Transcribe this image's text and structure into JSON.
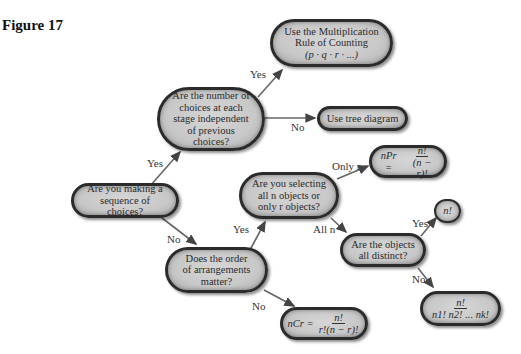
{
  "figure": {
    "label": "Figure 17"
  },
  "colors": {
    "node_fill": "#c8c8c8",
    "node_border": "#2b2b2b",
    "arrow": "#555555",
    "text": "#2a2a2a"
  },
  "nodes": {
    "start": {
      "text": "Are you making a sequence of choices?"
    },
    "independent": {
      "text": "Are the number of choices at each stage independent of previous choices?"
    },
    "multiplication": {
      "line1": "Use the Multiplication",
      "line2": "Rule of Counting",
      "line3": "(p · q · r · ...)"
    },
    "tree": {
      "text": "Use tree diagram"
    },
    "order": {
      "text": "Does the order of arrangements matter?"
    },
    "selecting": {
      "line1": "Are you selecting",
      "line2": "all n objects or",
      "line3": "only r objects?"
    },
    "permutation": {
      "lhs": "nPr =",
      "num": "n!",
      "den": "(n − r)!"
    },
    "distinct": {
      "text": "Are the objects all distinct?"
    },
    "factorial": {
      "text": "n!"
    },
    "combination": {
      "lhs": "nCr =",
      "num": "n!",
      "den": "r!(n − r)!"
    },
    "nondistinct": {
      "num": "n!",
      "den": "n1! n2! ... nk!"
    }
  },
  "edges": {
    "start_yes": "Yes",
    "start_no": "No",
    "independent_yes": "Yes",
    "independent_no": "No",
    "order_yes": "Yes",
    "order_no": "No",
    "selecting_only_r": "Only r",
    "selecting_all_n": "All n",
    "distinct_yes": "Yes",
    "distinct_no": "No"
  }
}
